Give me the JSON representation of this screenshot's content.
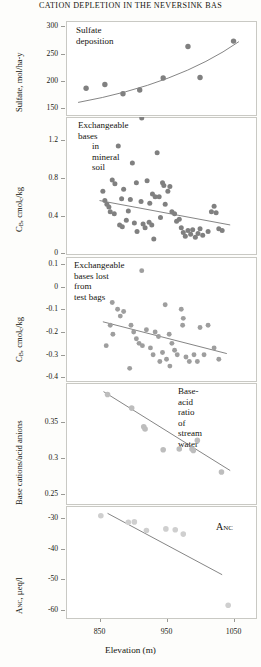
{
  "running_head": "CATION DEPLETION IN THE NEVERSINK BAS",
  "figure": {
    "x_axis": {
      "label": "Elevation (m)",
      "ticks": [
        850,
        950,
        1050
      ],
      "min": 800,
      "max": 1085
    },
    "marker_colors": {
      "dark_gray": "#808080",
      "mid_gray": "#9e9e9e",
      "light_gray": "#bdbdbd",
      "pale_gray": "#cfcfcf",
      "line": "#6f6f6f"
    }
  },
  "chart_data": [
    {
      "type": "scatter",
      "panel": 1,
      "title": "Sulfate deposition",
      "ylabel": "Sulfate, mol/ha-y",
      "xlabel": "Elevation (m)",
      "yticks": [
        150,
        200,
        250,
        300
      ],
      "ylim": [
        135,
        310
      ],
      "xlim": [
        800,
        1085
      ],
      "grid": false,
      "legend": "none",
      "points": [
        {
          "x": 830,
          "y": 186
        },
        {
          "x": 858,
          "y": 193
        },
        {
          "x": 885,
          "y": 176
        },
        {
          "x": 910,
          "y": 183
        },
        {
          "x": 945,
          "y": 205
        },
        {
          "x": 982,
          "y": 263
        },
        {
          "x": 1000,
          "y": 206
        },
        {
          "x": 1050,
          "y": 273
        }
      ],
      "trend": {
        "type": "curve",
        "x0": 818,
        "y0": 160,
        "x1": 1058,
        "y1": 272
      }
    },
    {
      "type": "scatter",
      "panel": 2,
      "title": "Exchangeable bases\nin mineral soil",
      "ylabel": "CB, cmolc/kg",
      "xlabel": "Elevation (m)",
      "yticks": [
        0,
        0.4,
        0.8,
        1.2
      ],
      "ylim": [
        -0.02,
        1.45
      ],
      "xlim": [
        800,
        1085
      ],
      "grid": false,
      "legend": "none",
      "points": [
        {
          "x": 913,
          "y": 1.44
        },
        {
          "x": 878,
          "y": 1.14
        },
        {
          "x": 936,
          "y": 1.07
        },
        {
          "x": 899,
          "y": 0.96
        },
        {
          "x": 873,
          "y": 0.74
        },
        {
          "x": 869,
          "y": 0.78
        },
        {
          "x": 905,
          "y": 0.75
        },
        {
          "x": 921,
          "y": 0.77
        },
        {
          "x": 944,
          "y": 0.75
        },
        {
          "x": 946,
          "y": 0.72
        },
        {
          "x": 855,
          "y": 0.66
        },
        {
          "x": 886,
          "y": 0.68
        },
        {
          "x": 929,
          "y": 0.63
        },
        {
          "x": 939,
          "y": 0.6
        },
        {
          "x": 952,
          "y": 0.66
        },
        {
          "x": 955,
          "y": 0.71
        },
        {
          "x": 858,
          "y": 0.56
        },
        {
          "x": 861,
          "y": 0.52
        },
        {
          "x": 864,
          "y": 0.49
        },
        {
          "x": 883,
          "y": 0.58
        },
        {
          "x": 896,
          "y": 0.57
        },
        {
          "x": 912,
          "y": 0.55
        },
        {
          "x": 925,
          "y": 0.53
        },
        {
          "x": 933,
          "y": 0.6
        },
        {
          "x": 948,
          "y": 0.52
        },
        {
          "x": 866,
          "y": 0.44
        },
        {
          "x": 872,
          "y": 0.42
        },
        {
          "x": 880,
          "y": 0.3
        },
        {
          "x": 884,
          "y": 0.28
        },
        {
          "x": 890,
          "y": 0.35
        },
        {
          "x": 893,
          "y": 0.45
        },
        {
          "x": 902,
          "y": 0.32
        },
        {
          "x": 906,
          "y": 0.23
        },
        {
          "x": 915,
          "y": 0.31
        },
        {
          "x": 918,
          "y": 0.27
        },
        {
          "x": 924,
          "y": 0.33
        },
        {
          "x": 928,
          "y": 0.3
        },
        {
          "x": 931,
          "y": 0.15
        },
        {
          "x": 941,
          "y": 0.38
        },
        {
          "x": 958,
          "y": 0.44
        },
        {
          "x": 962,
          "y": 0.42
        },
        {
          "x": 965,
          "y": 0.34
        },
        {
          "x": 969,
          "y": 0.36
        },
        {
          "x": 972,
          "y": 0.27
        },
        {
          "x": 975,
          "y": 0.22
        },
        {
          "x": 978,
          "y": 0.18
        },
        {
          "x": 982,
          "y": 0.24
        },
        {
          "x": 986,
          "y": 0.2
        },
        {
          "x": 989,
          "y": 0.25
        },
        {
          "x": 993,
          "y": 0.17
        },
        {
          "x": 997,
          "y": 0.21
        },
        {
          "x": 1000,
          "y": 0.26
        },
        {
          "x": 1004,
          "y": 0.19
        },
        {
          "x": 1012,
          "y": 0.23
        },
        {
          "x": 1017,
          "y": 0.44
        },
        {
          "x": 1021,
          "y": 0.5
        },
        {
          "x": 1024,
          "y": 0.43
        },
        {
          "x": 1028,
          "y": 0.26
        },
        {
          "x": 1033,
          "y": 0.24
        }
      ],
      "trend": {
        "type": "line",
        "x0": 850,
        "y0": 0.56,
        "x1": 1045,
        "y1": 0.3
      }
    },
    {
      "type": "scatter",
      "panel": 3,
      "title": "Exchangeable bases lost from\ntest bags",
      "ylabel": "CB, cmolc/kg",
      "xlabel": "Elevation (m)",
      "yticks": [
        0.1,
        0,
        -0.1,
        -0.2,
        -0.3,
        -0.4
      ],
      "ylim": [
        -0.42,
        0.13
      ],
      "xlim": [
        800,
        1085
      ],
      "grid": false,
      "legend": "none",
      "points": [
        {
          "x": 913,
          "y": 0.07
        },
        {
          "x": 869,
          "y": -0.07
        },
        {
          "x": 877,
          "y": -0.1
        },
        {
          "x": 881,
          "y": -0.13
        },
        {
          "x": 886,
          "y": -0.11
        },
        {
          "x": 948,
          "y": -0.08
        },
        {
          "x": 972,
          "y": -0.1
        },
        {
          "x": 975,
          "y": -0.14
        },
        {
          "x": 974,
          "y": -0.17
        },
        {
          "x": 866,
          "y": -0.17
        },
        {
          "x": 870,
          "y": -0.21
        },
        {
          "x": 897,
          "y": -0.17
        },
        {
          "x": 901,
          "y": -0.2
        },
        {
          "x": 905,
          "y": -0.23
        },
        {
          "x": 920,
          "y": -0.19
        },
        {
          "x": 933,
          "y": -0.2
        },
        {
          "x": 938,
          "y": -0.22
        },
        {
          "x": 954,
          "y": -0.21
        },
        {
          "x": 1000,
          "y": -0.18
        },
        {
          "x": 1012,
          "y": -0.17
        },
        {
          "x": 860,
          "y": -0.26
        },
        {
          "x": 909,
          "y": -0.25
        },
        {
          "x": 914,
          "y": -0.26
        },
        {
          "x": 926,
          "y": -0.27
        },
        {
          "x": 930,
          "y": -0.3
        },
        {
          "x": 944,
          "y": -0.29
        },
        {
          "x": 950,
          "y": -0.32
        },
        {
          "x": 958,
          "y": -0.25
        },
        {
          "x": 962,
          "y": -0.28
        },
        {
          "x": 966,
          "y": -0.3
        },
        {
          "x": 979,
          "y": -0.31
        },
        {
          "x": 984,
          "y": -0.33
        },
        {
          "x": 991,
          "y": -0.3
        },
        {
          "x": 996,
          "y": -0.33
        },
        {
          "x": 1006,
          "y": -0.3
        },
        {
          "x": 1021,
          "y": -0.27
        },
        {
          "x": 1028,
          "y": -0.32
        },
        {
          "x": 895,
          "y": -0.36
        },
        {
          "x": 940,
          "y": -0.33
        },
        {
          "x": 955,
          "y": -0.35
        }
      ],
      "trend": {
        "type": "line",
        "x0": 855,
        "y0": -0.155,
        "x1": 1040,
        "y1": -0.295
      }
    },
    {
      "type": "scatter",
      "panel": 4,
      "title": "Base-acid ratio\nof stream water",
      "ylabel": "Base cations/acid anions",
      "xlabel": "Elevation (m)",
      "yticks": [
        0.35,
        0.3,
        0.25
      ],
      "ylim": [
        0.235,
        0.405
      ],
      "xlim": [
        800,
        1085
      ],
      "grid": false,
      "legend": "none",
      "points": [
        {
          "x": 862,
          "y": 0.389
        },
        {
          "x": 898,
          "y": 0.37
        },
        {
          "x": 916,
          "y": 0.344
        },
        {
          "x": 918,
          "y": 0.341
        },
        {
          "x": 945,
          "y": 0.312
        },
        {
          "x": 969,
          "y": 0.313
        },
        {
          "x": 988,
          "y": 0.313
        },
        {
          "x": 990,
          "y": 0.311
        },
        {
          "x": 996,
          "y": 0.325
        },
        {
          "x": 1032,
          "y": 0.281
        }
      ],
      "trend": {
        "type": "line",
        "x0": 856,
        "y0": 0.393,
        "x1": 1045,
        "y1": 0.283
      }
    },
    {
      "type": "scatter",
      "panel": 5,
      "title": "ANC",
      "ylabel": "ANC, µeq/l",
      "xlabel": "Elevation (m)",
      "yticks": [
        -30,
        -40,
        -50,
        -60
      ],
      "ylim": [
        -63,
        -26
      ],
      "xlim": [
        800,
        1085
      ],
      "grid": false,
      "legend": "none",
      "points": [
        {
          "x": 852,
          "y": -29.2
        },
        {
          "x": 893,
          "y": -31.3
        },
        {
          "x": 902,
          "y": -31.2
        },
        {
          "x": 920,
          "y": -34.0
        },
        {
          "x": 949,
          "y": -33.5
        },
        {
          "x": 963,
          "y": -33.8
        },
        {
          "x": 975,
          "y": -35.2
        },
        {
          "x": 1042,
          "y": -58.5
        }
      ],
      "trend": {
        "type": "line",
        "x0": 862,
        "y0": -28.4,
        "x1": 1033,
        "y1": -48.5
      }
    }
  ]
}
